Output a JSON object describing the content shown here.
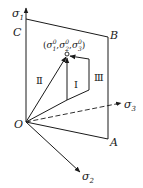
{
  "diagram": {
    "type": "stress-path-principal-space",
    "axes": {
      "sigma1": {
        "label": "σ",
        "sub": "1"
      },
      "sigma2": {
        "label": "σ",
        "sub": "2"
      },
      "sigma3": {
        "label": "σ",
        "sub": "3"
      }
    },
    "origin_label": "O",
    "plane_corners": {
      "A": "A",
      "B": "B",
      "C": "C"
    },
    "target_point": {
      "open": "(",
      "s1": "σ",
      "s1_sup": "0",
      "s1_sub": "1",
      "sep1": ",",
      "s2": "σ",
      "s2_sup": "0",
      "s2_sub": "2",
      "sep2": ",",
      "s3": "σ",
      "s3_sup": "0",
      "s3_sub": "3",
      "close": ")"
    },
    "paths": [
      {
        "id": "I",
        "label": "Ⅰ"
      },
      {
        "id": "II",
        "label": "Ⅱ"
      },
      {
        "id": "III",
        "label": "Ⅲ"
      }
    ],
    "colors": {
      "line": "#1a1a1a",
      "background": "#ffffff"
    }
  }
}
